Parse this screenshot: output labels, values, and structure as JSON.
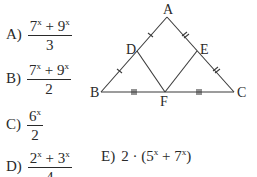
{
  "options": [
    {
      "label": "A)",
      "numerator": {
        "t1": "7",
        "e1": "x",
        "op": " + ",
        "t2": "9",
        "e2": "x"
      },
      "denominator": "3"
    },
    {
      "label": "B)",
      "numerator": {
        "t1": "7",
        "e1": "x",
        "op": " + ",
        "t2": "9",
        "e2": "x"
      },
      "denominator": "2"
    },
    {
      "label": "C)",
      "numerator": {
        "t1": "6",
        "e1": "x"
      },
      "denominator": "2"
    },
    {
      "label": "D)",
      "numerator": {
        "t1": "2",
        "e1": "x",
        "op": " + ",
        "t2": "3",
        "e2": "x"
      },
      "denominator": "4"
    },
    {
      "label": "E)",
      "expr": {
        "pre": "2 · (",
        "t1": "5",
        "e1": "x",
        "op": " + ",
        "t2": "7",
        "e2": "x",
        "post": ")"
      }
    }
  ],
  "figure": {
    "vertices": {
      "A": "A",
      "B": "B",
      "C": "C",
      "D": "D",
      "E": "E",
      "F": "F"
    },
    "line_color": "#3a3a3a"
  }
}
